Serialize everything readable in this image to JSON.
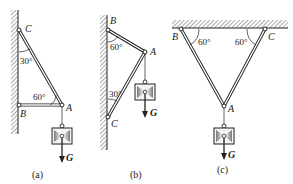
{
  "figure": {
    "colors": {
      "ink": "#222222",
      "hatch": "#555555",
      "weight_fill": "#e8e8e8",
      "weight_shade": "#888888"
    },
    "panels": [
      {
        "caption": "(a)",
        "points": {
          "C": "C",
          "B": "B",
          "A": "A"
        },
        "angles": [
          "30°",
          "60°"
        ],
        "load": "G",
        "support": "vertical wall"
      },
      {
        "caption": "(b)",
        "points": {
          "B": "B",
          "A": "A",
          "C": "C"
        },
        "angles": [
          "60°",
          "30°"
        ],
        "load": "G",
        "support": "vertical wall"
      },
      {
        "caption": "(c)",
        "points": {
          "B": "B",
          "C": "C",
          "A": "A"
        },
        "angles": [
          "60°",
          "60°"
        ],
        "load": "G",
        "support": "ceiling"
      }
    ]
  }
}
